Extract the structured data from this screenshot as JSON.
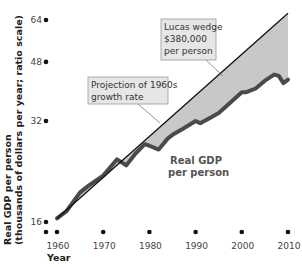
{
  "chart_data": {
    "type": "line",
    "title": "",
    "xlabel": "Year",
    "ylabel": "Real GDP per person (thousands of dollars per year; ratio scale)",
    "y_scale": "log",
    "xlim": [
      1957,
      2010
    ],
    "ylim": [
      16,
      64
    ],
    "x_ticks": [
      "1960",
      "1970",
      "1980",
      "1990",
      "2000",
      "2010"
    ],
    "y_ticks": [
      "16",
      "32",
      "48",
      "64"
    ],
    "grid": false,
    "series": [
      {
        "name": "Real GDP per person",
        "x": [
          1960,
          1962,
          1965,
          1967,
          1970,
          1973,
          1975,
          1977,
          1979,
          1980,
          1982,
          1984,
          1985,
          1987,
          1990,
          1991,
          1993,
          1995,
          1997,
          2000,
          2001,
          2003,
          2005,
          2007,
          2008,
          2009,
          2010
        ],
        "values": [
          16.4,
          17.2,
          19.6,
          20.6,
          22.0,
          24.6,
          23.6,
          25.6,
          27.3,
          27.0,
          26.3,
          28.4,
          29.1,
          30.2,
          32.0,
          31.5,
          32.6,
          33.8,
          35.8,
          39.0,
          39.0,
          40.0,
          42.2,
          44.0,
          43.6,
          41.5,
          42.5
        ]
      },
      {
        "name": "Projection of 1960s growth rate",
        "x": [
          1960,
          2010
        ],
        "values": [
          16.4,
          67.0
        ]
      }
    ],
    "annotations": [
      {
        "text": "Lucas wedge $380,000 per person",
        "type": "shaded area between projection and actual"
      },
      {
        "text": "Projection of 1960s growth rate",
        "type": "callout"
      },
      {
        "text": "Real GDP per person",
        "type": "series label"
      }
    ]
  },
  "labels": {
    "lucas_line1": "Lucas wedge",
    "lucas_line2": "$380,000",
    "lucas_line3": "per person",
    "proj_line1": "Projection of 1960s",
    "proj_line2": "growth rate",
    "gdp_line1": "Real GDP",
    "gdp_line2": "per person",
    "ylabel_line1": "Real GDP per person",
    "ylabel_line2": "(thousands of dollars per year; ratio scale)",
    "xlabel": "Year"
  },
  "colors": {
    "wedge_fill": "#c8c8c8",
    "gdp_line": "#4a4a4a",
    "projection_line": "#111111"
  }
}
